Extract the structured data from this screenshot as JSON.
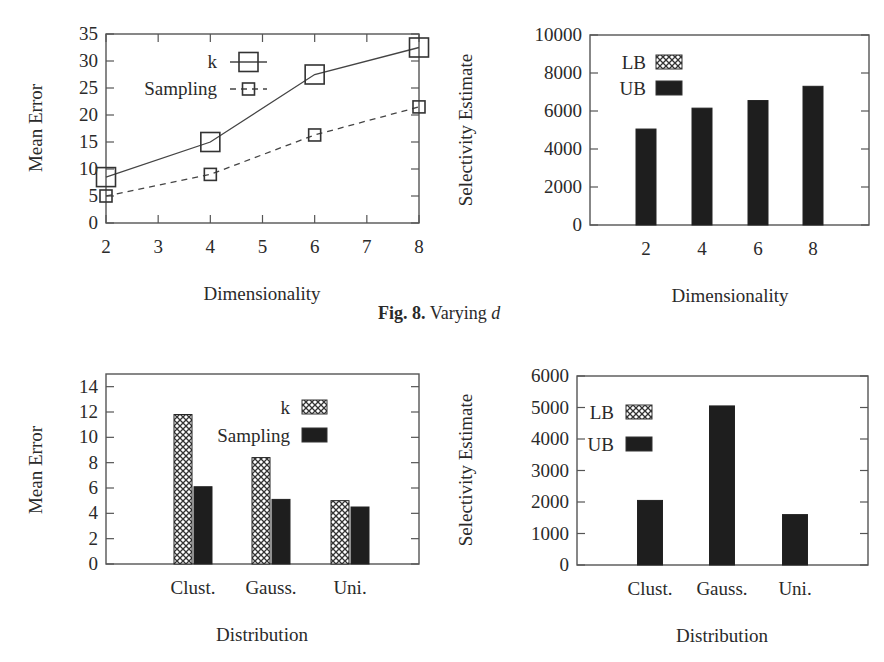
{
  "figure": {
    "caption_label": "Fig. 8.",
    "caption_text": "Varying",
    "caption_var": "d"
  },
  "chart_data": [
    {
      "id": "mean-error-vs-dimensionality",
      "type": "line",
      "title": "",
      "xlabel": "Dimensionality",
      "ylabel": "Mean Error",
      "x": [
        2,
        4,
        6,
        8
      ],
      "xticks": [
        2,
        3,
        4,
        5,
        6,
        7,
        8
      ],
      "xlim": [
        2,
        8
      ],
      "yticks": [
        0,
        5,
        10,
        15,
        20,
        25,
        30,
        35
      ],
      "ylim": [
        0,
        35
      ],
      "legend_position": "upper-left-inside",
      "series": [
        {
          "name": "k",
          "values": [
            8.5,
            15.0,
            27.5,
            32.5
          ],
          "line": "solid",
          "marker": "large-square"
        },
        {
          "name": "Sampling",
          "values": [
            5.0,
            9.0,
            16.3,
            21.5
          ],
          "line": "dashed",
          "marker": "small-square"
        }
      ]
    },
    {
      "id": "selectivity-vs-dimensionality",
      "type": "bar",
      "title": "",
      "xlabel": "Dimensionality",
      "ylabel": "Selectivity Estimate",
      "categories": [
        "2",
        "4",
        "6",
        "8"
      ],
      "yticks": [
        0,
        2000,
        4000,
        6000,
        8000,
        10000
      ],
      "ylim": [
        0,
        10000
      ],
      "legend_position": "upper-left-inside",
      "series": [
        {
          "name": "LB",
          "values": [
            0,
            0,
            0,
            0
          ],
          "fill": "crosshatch"
        },
        {
          "name": "UB",
          "values": [
            5050,
            6150,
            6550,
            7300
          ],
          "fill": "solid"
        }
      ]
    },
    {
      "id": "mean-error-vs-distribution",
      "type": "bar",
      "title": "",
      "xlabel": "Distribution",
      "ylabel": "Mean Error",
      "categories": [
        "Clust.",
        "Gauss.",
        "Uni."
      ],
      "yticks": [
        0,
        2,
        4,
        6,
        8,
        10,
        12,
        14
      ],
      "ylim": [
        0,
        15
      ],
      "legend_position": "upper-right-inside",
      "series": [
        {
          "name": "k",
          "values": [
            11.8,
            8.4,
            5.0
          ],
          "fill": "crosshatch"
        },
        {
          "name": "Sampling",
          "values": [
            6.1,
            5.1,
            4.5
          ],
          "fill": "solid"
        }
      ]
    },
    {
      "id": "selectivity-vs-distribution",
      "type": "bar",
      "title": "",
      "xlabel": "Distribution",
      "ylabel": "Selectivity Estimate",
      "categories": [
        "Clust.",
        "Gauss.",
        "Uni."
      ],
      "yticks": [
        0,
        1000,
        2000,
        3000,
        4000,
        5000,
        6000
      ],
      "ylim": [
        0,
        6000
      ],
      "legend_position": "upper-left-inside",
      "series": [
        {
          "name": "LB",
          "values": [
            0,
            0,
            0
          ],
          "fill": "crosshatch"
        },
        {
          "name": "UB",
          "values": [
            2050,
            5050,
            1600
          ],
          "fill": "solid"
        }
      ]
    }
  ],
  "colors": {
    "axis": "#555555",
    "text": "#2a2a2a",
    "solid_fill": "#1e1e1e",
    "hatch_line": "#333333",
    "background": "#ffffff"
  }
}
